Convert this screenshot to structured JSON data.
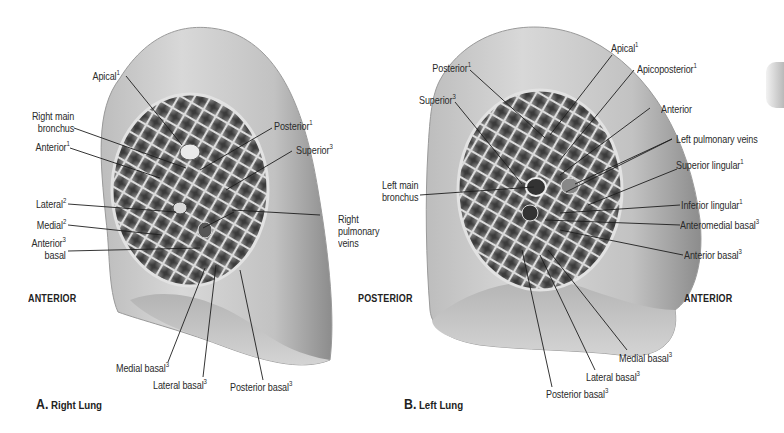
{
  "figure": {
    "panels": [
      {
        "caption_letter": "A.",
        "caption_text": "Right Lung",
        "orientation_left": "ANTERIOR",
        "labels": {
          "apical": {
            "text": "Apical",
            "sup": "1"
          },
          "right_main_bronchus_1": {
            "text": "Right main"
          },
          "right_main_bronchus_2": {
            "text": "bronchus"
          },
          "anterior": {
            "text": "Anterior",
            "sup": "1"
          },
          "lateral": {
            "text": "Lateral",
            "sup": "2"
          },
          "medial": {
            "text": "Medial",
            "sup": "2"
          },
          "anterior_basal_1": {
            "text": "Anterior",
            "sup": "3"
          },
          "anterior_basal_2": {
            "text": "basal"
          },
          "posterior": {
            "text": "Posterior",
            "sup": "1"
          },
          "superior": {
            "text": "Superior",
            "sup": "3"
          },
          "right_pulmonary_veins_1": {
            "text": "Right"
          },
          "right_pulmonary_veins_2": {
            "text": "pulmonary"
          },
          "right_pulmonary_veins_3": {
            "text": "veins"
          },
          "medial_basal": {
            "text": "Medial basal",
            "sup": "3"
          },
          "lateral_basal": {
            "text": "Lateral basal",
            "sup": "3"
          },
          "posterior_basal": {
            "text": "Posterior basal",
            "sup": "3"
          }
        }
      },
      {
        "caption_letter": "B.",
        "caption_text": "Left Lung",
        "orientation_left": "POSTERIOR",
        "orientation_right": "ANTERIOR",
        "labels": {
          "posterior": {
            "text": "Posterior",
            "sup": "1"
          },
          "superior": {
            "text": "Superior",
            "sup": "3"
          },
          "left_main_bronchus_1": {
            "text": "Left main"
          },
          "left_main_bronchus_2": {
            "text": "bronchus"
          },
          "apical": {
            "text": "Apical",
            "sup": "1"
          },
          "apicoposterior": {
            "text": "Apicoposterior",
            "sup": "1"
          },
          "anterior": {
            "text": "Anterior"
          },
          "left_pulmonary_veins": {
            "text": "Left pulmonary veins"
          },
          "superior_lingular": {
            "text": "Superior lingular",
            "sup": "1"
          },
          "inferior_lingular": {
            "text": "Inferior lingular",
            "sup": "1"
          },
          "anteromedial_basal": {
            "text": "Anteromedial basal",
            "sup": "3"
          },
          "anterior_basal": {
            "text": "Anterior basal",
            "sup": "3"
          },
          "medial_basal": {
            "text": "Medial basal",
            "sup": "3"
          },
          "lateral_basal": {
            "text": "Lateral basal",
            "sup": "3"
          },
          "posterior_basal": {
            "text": "Posterior basal",
            "sup": "3"
          }
        }
      }
    ],
    "colors": {
      "background": "#ffffff",
      "lung_surface": "#c9c9c9",
      "lung_shadow": "#8e8e8e",
      "section_dark": "#3a3a3a",
      "leader_line": "#1e1e1e"
    }
  }
}
